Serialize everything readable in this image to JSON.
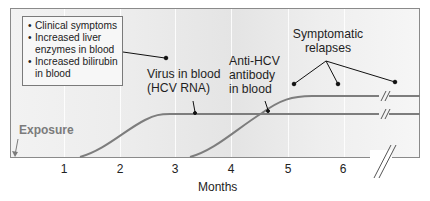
{
  "diagram": {
    "type": "timeline",
    "title": "",
    "info_box": {
      "items": [
        "Clinical symptoms",
        "Increased liver enzymes in blood",
        "Increased bilirubin in blood"
      ],
      "items_display": [
        [
          "Clinical symptoms"
        ],
        [
          "Increased liver",
          "enzymes in blood"
        ],
        [
          "Increased bilirubin",
          "in blood"
        ]
      ]
    },
    "labels": {
      "virus_line1": "Virus in blood",
      "virus_line2": "(HCV RNA)",
      "antibody_line1": "Anti-HCV",
      "antibody_line2": "antibody",
      "antibody_line3": "in blood",
      "relapses_line1": "Symptomatic",
      "relapses_line2": "relapses",
      "exposure": "Exposure"
    },
    "x_axis": {
      "title": "Months",
      "ticks": [
        "1",
        "2",
        "3",
        "4",
        "5",
        "6"
      ]
    },
    "curves": [
      {
        "name": "Virus in blood (HCV RNA)",
        "onset_month": 1.3,
        "plateau_month": 2.8,
        "continues": true,
        "axis_break": true
      },
      {
        "name": "Anti-HCV antibody in blood",
        "onset_month": 3.3,
        "plateau_month": 5.3,
        "continues": true,
        "axis_break": true
      }
    ],
    "colors": {
      "curve": "#7d7d7d",
      "frame": "#8a8a8a",
      "text": "#1f1f1f",
      "exposure_text": "#7b7b7b",
      "pointer": "#111111"
    }
  }
}
